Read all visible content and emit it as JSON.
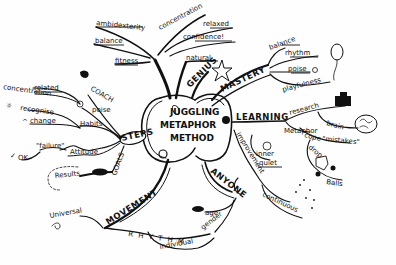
{
  "central_node": {
    "lines": [
      "JUGGLING",
      "METAPHOR",
      "METHOD"
    ]
  },
  "main_branches": {
    "genius": {
      "label": "GENIUS"
    },
    "mastery": {
      "label": "MASTERY"
    },
    "learning": {
      "label": "LEARNING"
    },
    "anyone": {
      "label": "ANYONE"
    },
    "movement": {
      "label": "MOVEMENT"
    },
    "steps": {
      "label": "STEPS"
    },
    "fitness": {
      "label": "fitness"
    }
  },
  "sub_labels": {
    "ambidexterity": "ambidexterity",
    "balance_top": "balance",
    "concentration_top": "concentration",
    "relaxed_top": "relaxed",
    "confidence": "confidence!",
    "natural": "natural",
    "balance_mastery": "balance",
    "rhythm": "rhythm",
    "poise_mastery": "poise",
    "playfulness": "playfulness",
    "research": "research",
    "brain": "brain",
    "metaphor": "Metaphor",
    "cope": "cope",
    "mistakes": "\"mistakes\"",
    "drop": "drop",
    "balls": "Balls",
    "inner": "inner",
    "quiet": "quiet",
    "improvement": "improvement",
    "continuous": "continuous",
    "age": "age",
    "gender": "gender",
    "rhythm_movement": "R H Y T H M",
    "individual": "individual",
    "universal": "Universal",
    "concentration_left": "concentration",
    "related_left": "related",
    "coach": "COACH",
    "recognise": "recognise",
    "poise_left": "poise",
    "change": "change",
    "habits": "Habits",
    "failure": "\"failure\"",
    "attitude": "Attitude",
    "ok": "OK",
    "results": "Results",
    "goals": "GOALS"
  }
}
